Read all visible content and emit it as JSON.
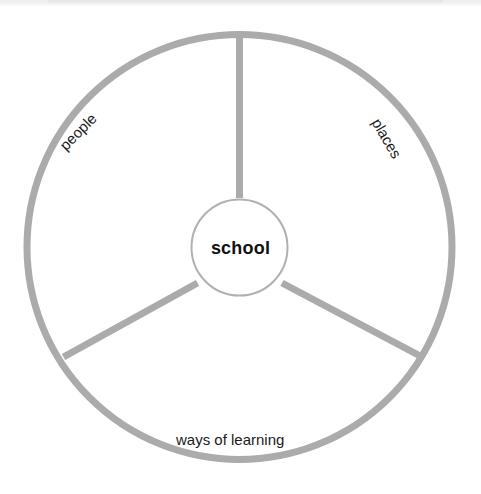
{
  "diagram": {
    "type": "hub-and-spoke-wheel",
    "center": {
      "label": "school"
    },
    "segments": [
      {
        "id": "people",
        "label": "people"
      },
      {
        "id": "places",
        "label": "places"
      },
      {
        "id": "ways-of-learning",
        "label": "ways of learning"
      }
    ],
    "colors": {
      "stroke": "#ababab",
      "inner_circle_stroke": "#b0b0b0",
      "text": "#1a1a1a",
      "background": "#ffffff"
    }
  }
}
